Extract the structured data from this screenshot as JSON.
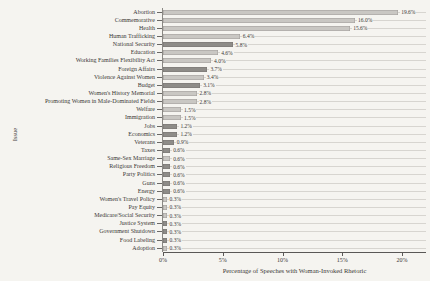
{
  "figure": {
    "x_axis_title": "Percentage of Speeches with Woman-Invoked Rhetoric",
    "y_axis_title": "Issue"
  },
  "colors": {
    "paper": "#f5f4f0",
    "bar_light": "#c9c7c3",
    "bar_dark": "#8e8c88",
    "row_line": "#d7d5d0",
    "axis": "#5a5856",
    "text": "#3b3836"
  },
  "chart_data": {
    "type": "bar",
    "orientation": "horizontal",
    "title": "",
    "xlabel": "Percentage of Speeches with Woman-Invoked Rhetoric",
    "ylabel": "Issue",
    "xlim": [
      0,
      22
    ],
    "grid": "per-row horizontal guide lines",
    "legend": "none",
    "x_ticks": [
      {
        "value": 0,
        "label": "0%"
      },
      {
        "value": 5,
        "label": "5%"
      },
      {
        "value": 10,
        "label": "10%"
      },
      {
        "value": 15,
        "label": "15%"
      },
      {
        "value": 20,
        "label": "20%"
      }
    ],
    "categories": [
      "Abortion",
      "Commemorative",
      "Health",
      "Human Trafficking",
      "National Security",
      "Education",
      "Working Families Flexibility Act",
      "Foreign Affairs",
      "Violence Against Women",
      "Budget",
      "Women's History Memorial",
      "Promoting Women in Male-Dominated Fields",
      "Welfare",
      "Immigration",
      "Jobs",
      "Economics",
      "Veterans",
      "Taxes",
      "Same-Sex Marriage",
      "Religious Freedom",
      "Party Politics",
      "Guns",
      "Energy",
      "Women's Travel Policy",
      "Pay Equity",
      "Medicare/Social Security",
      "Justice System",
      "Government Shutdown",
      "Food Labeling",
      "Adoption"
    ],
    "values": [
      19.6,
      16.0,
      15.6,
      6.4,
      5.8,
      4.6,
      4.0,
      3.7,
      3.4,
      3.1,
      2.8,
      2.8,
      1.5,
      1.5,
      1.2,
      1.2,
      0.9,
      0.6,
      0.6,
      0.6,
      0.6,
      0.6,
      0.6,
      0.3,
      0.3,
      0.3,
      0.3,
      0.3,
      0.3,
      0.3
    ],
    "value_labels": [
      "19.6%",
      "16.0%",
      "15.6%",
      "6.4%",
      "5.8%",
      "4.6%",
      "4.0%",
      "3.7%",
      "3.4%",
      "3.1%",
      "2.8%",
      "2.8%",
      "1.5%",
      "1.5%",
      "1.2%",
      "1.2%",
      "0.9%",
      "0.6%",
      "0.6%",
      "0.6%",
      "0.6%",
      "0.6%",
      "0.6%",
      "0.3%",
      "0.3%",
      "0.3%",
      "0.3%",
      "0.3%",
      "0.3%",
      "0.3%"
    ],
    "bar_shades": [
      "light",
      "light",
      "light",
      "light",
      "dark",
      "light",
      "light",
      "dark",
      "light",
      "dark",
      "light",
      "light",
      "light",
      "light",
      "dark",
      "dark",
      "dark",
      "dark",
      "light",
      "dark",
      "dark",
      "dark",
      "dark",
      "light",
      "light",
      "light",
      "dark",
      "dark",
      "dark",
      "light"
    ]
  }
}
